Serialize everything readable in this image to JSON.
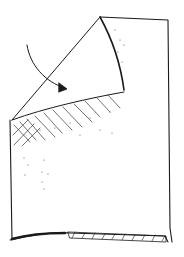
{
  "illustration": {
    "subject": "folded sheet corner",
    "alt": "Hand-drawn sketch of a square sheet with its top-left corner folded diagonally down, with a curved arrow indicating the folding direction",
    "colors": {
      "ink": "#1a1a1a",
      "paper": "#ffffff",
      "shading": "#555555"
    },
    "elements": [
      "sheet",
      "folded-flap",
      "fold-arrow",
      "hatching",
      "stipple-dots",
      "bottom-edge-shadow"
    ]
  }
}
